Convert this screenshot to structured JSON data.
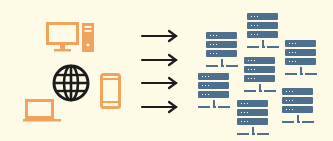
{
  "diagram": {
    "title": "",
    "colors": {
      "background": "#fdfbe6",
      "device": "#f0a35e",
      "globe": "#1c1c1c",
      "arrow": "#1c1c1c",
      "server": "#4f6f8f"
    },
    "left_group": {
      "icons": [
        "desktop-computer-icon",
        "globe-icon",
        "smartphone-icon",
        "laptop-icon"
      ]
    },
    "arrows": {
      "count": 4,
      "direction": "right"
    },
    "right_group": {
      "servers": [
        {
          "x": 247,
          "y": 13
        },
        {
          "x": 206,
          "y": 32
        },
        {
          "x": 285,
          "y": 40
        },
        {
          "x": 244,
          "y": 57
        },
        {
          "x": 198,
          "y": 73
        },
        {
          "x": 282,
          "y": 88
        },
        {
          "x": 237,
          "y": 100
        }
      ]
    }
  }
}
